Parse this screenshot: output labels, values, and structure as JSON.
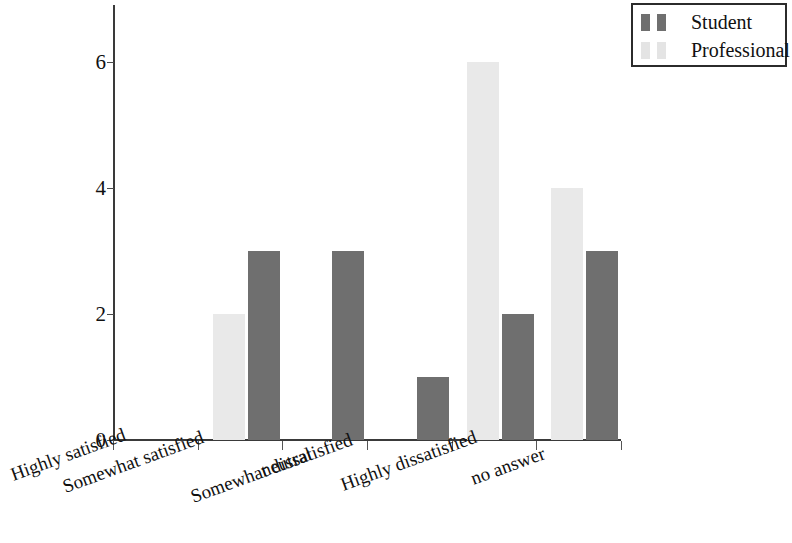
{
  "chart_data": {
    "type": "bar",
    "title": "",
    "subtitle": "",
    "xlabel": "",
    "ylabel": "",
    "categories": [
      "Highly satisfied",
      "Somewhat satisfied",
      "neutral",
      "Somewhat dissatisfied",
      "Highly dissatisfied",
      "no answer"
    ],
    "series": [
      {
        "name": "Professional",
        "color": "#e9e9e9",
        "values": [
          0,
          2,
          0,
          0,
          6,
          4
        ]
      },
      {
        "name": "Student",
        "color": "#6f6f6f",
        "values": [
          0,
          3,
          3,
          1,
          2,
          3
        ]
      }
    ],
    "ylim": [
      0,
      6.9
    ],
    "y_ticks": [
      0,
      2,
      4,
      6
    ],
    "y_tick_labels": [
      "0",
      "2",
      "4",
      "6"
    ],
    "grid": false,
    "legend_position": "top-right",
    "x_tick_label_rotation": -20,
    "series_order_in_group": [
      "Professional",
      "Student"
    ],
    "annotations": []
  },
  "legend": {
    "entries": [
      {
        "label": "Student",
        "color": "#6f6f6f"
      },
      {
        "label": "Professional",
        "color": "#e4e4e4"
      }
    ]
  },
  "axis": {
    "y_labels": [
      "6",
      "4",
      "2",
      "0"
    ],
    "x_labels": [
      "Highly satisfied",
      "Somewhat satisfied",
      "neutral",
      "Somewhat dissatisfied",
      "Highly dissatisfied",
      "no answer"
    ]
  }
}
